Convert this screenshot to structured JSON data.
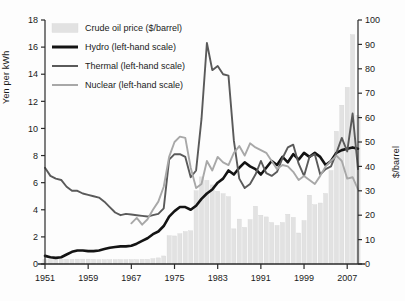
{
  "axes": {
    "left": {
      "label": "Yen per kWh",
      "min": 0,
      "max": 18,
      "ticks": [
        0,
        2,
        4,
        6,
        8,
        10,
        12,
        14,
        16,
        18
      ]
    },
    "right": {
      "label": "$/barrel",
      "min": 0,
      "max": 100,
      "ticks": [
        0,
        10,
        20,
        30,
        40,
        50,
        60,
        70,
        80,
        90,
        100
      ]
    },
    "x": {
      "label": "",
      "min": 1951,
      "max": 2009,
      "ticks": [
        1951,
        1959,
        1967,
        1975,
        1983,
        1991,
        1999,
        2007
      ]
    }
  },
  "legend": {
    "items": [
      {
        "label": "Crude oil price ($/barrel)",
        "type": "bar",
        "color": "#e2e2e2"
      },
      {
        "label": "Hydro (left-hand scale)",
        "type": "line",
        "color": "#141414"
      },
      {
        "label": "Thermal (left-hand scale)",
        "type": "line",
        "color": "#5a5a5a"
      },
      {
        "label": "Nuclear (left-hand scale)",
        "type": "line",
        "color": "#a8a8a8"
      }
    ]
  },
  "colors": {
    "bar_fill": "#e2e2e2",
    "hydro": "#141414",
    "thermal": "#5a5a5a",
    "nuclear": "#a8a8a8",
    "axis": "#2b2b2b",
    "text": "#1a1a1a",
    "background": "#fdfdfd"
  },
  "chart_data": {
    "type": "line",
    "title": "",
    "xlabel": "",
    "ylabel": "Yen per kWh",
    "y2label": "$/barrel",
    "xlim": [
      1951,
      2009
    ],
    "ylim": [
      0,
      18
    ],
    "y2lim": [
      0,
      100
    ],
    "grid": false,
    "legend_position": "top-left",
    "x": [
      1951,
      1952,
      1953,
      1954,
      1955,
      1956,
      1957,
      1958,
      1959,
      1960,
      1961,
      1962,
      1963,
      1964,
      1965,
      1966,
      1967,
      1968,
      1969,
      1970,
      1971,
      1972,
      1973,
      1974,
      1975,
      1976,
      1977,
      1978,
      1979,
      1980,
      1981,
      1982,
      1983,
      1984,
      1985,
      1986,
      1987,
      1988,
      1989,
      1990,
      1991,
      1992,
      1993,
      1994,
      1995,
      1996,
      1997,
      1998,
      1999,
      2000,
      2001,
      2002,
      2003,
      2004,
      2005,
      2006,
      2007,
      2008,
      2009
    ],
    "series": [
      {
        "name": "Hydro (left-hand scale)",
        "axis": "left",
        "color": "#141414",
        "values": [
          0.6,
          0.5,
          0.45,
          0.5,
          0.7,
          0.9,
          1.0,
          1.0,
          0.95,
          0.95,
          1.0,
          1.1,
          1.2,
          1.25,
          1.3,
          1.3,
          1.35,
          1.5,
          1.7,
          1.9,
          2.2,
          2.4,
          2.8,
          3.5,
          3.9,
          4.2,
          4.2,
          4.0,
          4.3,
          4.8,
          5.2,
          5.5,
          6.0,
          6.3,
          6.9,
          6.6,
          7.1,
          7.5,
          7.2,
          7.0,
          6.6,
          7.1,
          7.6,
          7.3,
          7.9,
          7.5,
          8.1,
          7.7,
          8.2,
          7.9,
          8.2,
          7.9,
          7.3,
          7.6,
          8.2,
          8.4,
          8.5,
          8.6,
          8.5
        ]
      },
      {
        "name": "Thermal (left-hand scale)",
        "axis": "left",
        "color": "#5a5a5a",
        "values": [
          7.1,
          6.5,
          6.3,
          6.2,
          5.7,
          5.4,
          5.4,
          5.2,
          5.1,
          5.0,
          4.9,
          4.6,
          4.2,
          3.8,
          3.6,
          3.7,
          3.65,
          3.6,
          3.55,
          3.5,
          3.6,
          3.7,
          4.1,
          7.7,
          8.1,
          8.1,
          7.9,
          6.4,
          6.9,
          10.7,
          16.3,
          14.3,
          14.6,
          14.0,
          13.9,
          9.1,
          6.3,
          5.6,
          5.9,
          6.6,
          7.6,
          6.7,
          6.5,
          6.8,
          7.8,
          8.6,
          8.8,
          7.4,
          6.5,
          7.9,
          8.1,
          6.6,
          7.0,
          7.2,
          8.2,
          9.3,
          8.3,
          11.1,
          7.0
        ]
      },
      {
        "name": "Nuclear (left-hand scale)",
        "axis": "left",
        "color": "#a8a8a8",
        "values": [
          null,
          null,
          null,
          null,
          null,
          null,
          null,
          null,
          null,
          null,
          null,
          null,
          null,
          null,
          null,
          null,
          3.0,
          3.4,
          2.9,
          3.3,
          4.0,
          4.6,
          5.7,
          7.9,
          9.0,
          9.4,
          9.3,
          7.1,
          5.6,
          5.9,
          7.6,
          6.9,
          7.9,
          7.5,
          7.3,
          8.2,
          8.7,
          8.0,
          8.9,
          8.6,
          8.4,
          8.2,
          7.6,
          7.0,
          7.3,
          7.2,
          6.8,
          6.2,
          6.5,
          6.2,
          5.9,
          6.5,
          7.2,
          7.6,
          8.0,
          7.6,
          6.3,
          6.4,
          5.5
        ]
      }
    ],
    "bars": {
      "name": "Crude oil price ($/barrel)",
      "axis": "right",
      "color": "#e2e2e2",
      "values": [
        1.8,
        1.8,
        1.9,
        1.9,
        1.9,
        1.9,
        2.0,
        2.0,
        2.0,
        1.9,
        1.8,
        1.8,
        1.8,
        1.8,
        1.8,
        1.8,
        1.8,
        1.8,
        1.9,
        1.9,
        2.2,
        2.5,
        3.3,
        11.6,
        11.5,
        12.4,
        13.3,
        13.6,
        30.0,
        35.7,
        34.3,
        32.4,
        29.8,
        28.8,
        27.6,
        14.4,
        18.4,
        15.0,
        18.2,
        23.7,
        20.0,
        19.3,
        17.0,
        15.8,
        17.0,
        20.4,
        19.1,
        12.7,
        17.8,
        28.2,
        24.3,
        25.0,
        28.9,
        38.3,
        54.4,
        65.1,
        72.4,
        94.0,
        61.0
      ]
    }
  }
}
